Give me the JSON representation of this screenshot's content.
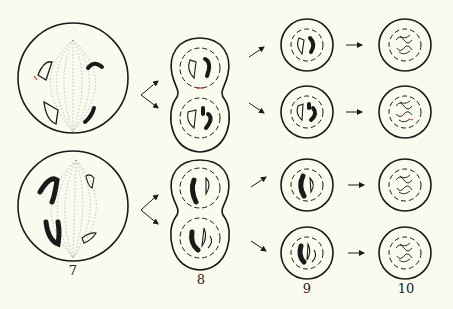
{
  "figure": {
    "labels": [
      "7",
      "8",
      "9",
      "10"
    ],
    "rows": [
      "top",
      "bottom"
    ],
    "colors": {
      "background": "#fbfaef",
      "ink": "#1a1a1a",
      "spindle": "#9a9a9a",
      "accent_red": "#c0392b"
    }
  }
}
